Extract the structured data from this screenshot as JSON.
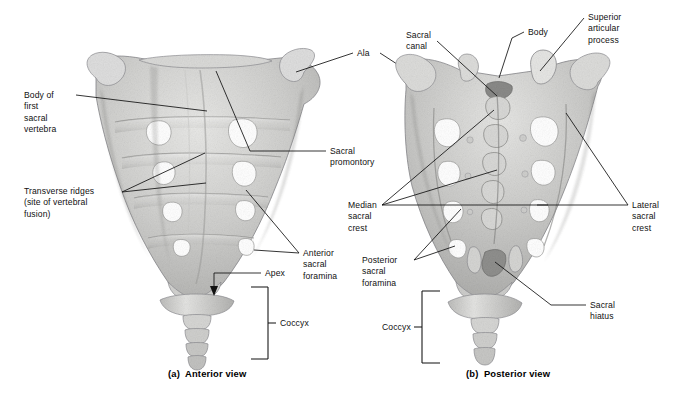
{
  "figure": {
    "background": "#ffffff",
    "bone_light": "#e3e3e1",
    "bone_mid": "#c4c4c2",
    "bone_dark": "#9a9a98",
    "line_color": "#111111"
  },
  "panels": [
    {
      "id": "a",
      "caption": "(a)  Anterior view",
      "labels": [
        {
          "name": "body-of-first-sacral-vertebra",
          "text": "Body of\nfirst\nsacral\nvertebra",
          "x": 24,
          "y": 90
        },
        {
          "name": "transverse-ridges",
          "text": "Transverse ridges\n(site of vertebral\nfusion)",
          "x": 24,
          "y": 186
        },
        {
          "name": "ala",
          "text": "Ala",
          "x": 357,
          "y": 48
        },
        {
          "name": "sacral-promontory",
          "text": "Sacral\npromontory",
          "x": 330,
          "y": 146
        },
        {
          "name": "anterior-sacral-foramina",
          "text": "Anterior\nsacral\nforamina",
          "x": 303,
          "y": 248
        },
        {
          "name": "apex",
          "text": "Apex",
          "x": 265,
          "y": 268
        },
        {
          "name": "coccyx-a",
          "text": "Coccyx",
          "x": 280,
          "y": 318
        }
      ]
    },
    {
      "id": "b",
      "caption": "(b)  Posterior view",
      "labels": [
        {
          "name": "sacral-canal",
          "text": "Sacral\ncanal",
          "x": 406,
          "y": 30
        },
        {
          "name": "body",
          "text": "Body",
          "x": 528,
          "y": 27
        },
        {
          "name": "superior-articular-process",
          "text": "Superior\narticular\nprocess",
          "x": 588,
          "y": 12
        },
        {
          "name": "median-sacral-crest",
          "text": "Median\nsacral\ncrest",
          "x": 348,
          "y": 200
        },
        {
          "name": "posterior-sacral-foramina",
          "text": "Posterior\nsacral\nforamina",
          "x": 362,
          "y": 255
        },
        {
          "name": "lateral-sacral-crest",
          "text": "Lateral\nsacral\ncrest",
          "x": 632,
          "y": 200
        },
        {
          "name": "sacral-hiatus",
          "text": "Sacral\nhiatus",
          "x": 590,
          "y": 300
        },
        {
          "name": "coccyx-b",
          "text": "Coccyx",
          "x": 382,
          "y": 322
        }
      ]
    }
  ],
  "captions": {
    "anterior": "(a)  Anterior view",
    "posterior": "(b)  Posterior view",
    "anterior_x": 168,
    "anterior_y": 368,
    "posterior_x": 466,
    "posterior_y": 368
  }
}
